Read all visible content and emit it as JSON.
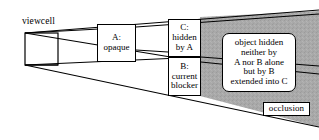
{
  "figure": {
    "type": "occlusion-diagram",
    "background_color": "#ffffff",
    "line_color": "#000000",
    "shaded_region_color": "#a8a8a8",
    "viewcell_label": "viewcell",
    "occlusion_label": "occlusion"
  },
  "boxes": {
    "a": "A:\nopaque",
    "c": "C:\nhidden\nby A",
    "b": "B:\ncurrent\nblocker",
    "object": "object hidden\nneither by\nA nor B alone\nbut by B\nextended into C"
  }
}
